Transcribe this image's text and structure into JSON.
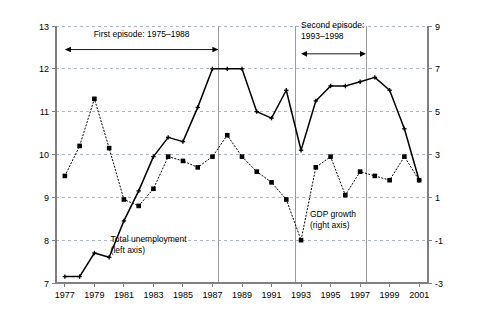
{
  "chart_data": {
    "type": "line",
    "title": "",
    "xlabel": "",
    "ylabel": "",
    "x": [
      1977,
      1978,
      1979,
      1980,
      1981,
      1982,
      1983,
      1984,
      1985,
      1986,
      1987,
      1988,
      1989,
      1990,
      1991,
      1992,
      1993,
      1994,
      1995,
      1996,
      1997,
      1998,
      1999,
      2000,
      2001
    ],
    "xlim": [
      1976.4,
      2001.6
    ],
    "xticks": [
      1977,
      1979,
      1981,
      1983,
      1985,
      1987,
      1989,
      1991,
      1993,
      1995,
      1997,
      1999,
      2001
    ],
    "xtick_labels": [
      "1977",
      "1979",
      "1981",
      "1983",
      "1985",
      "1987",
      "1989",
      "1991",
      "1993",
      "1995",
      "1997",
      "1999",
      "2001"
    ],
    "grid": true,
    "legend_position": "inline-annotation",
    "left_axis": {
      "label": "Total unemployment (left axis)",
      "ylim": [
        7,
        13
      ],
      "yticks": [
        7,
        8,
        9,
        10,
        11,
        12,
        13
      ],
      "ytick_labels": [
        "7",
        "8",
        "9",
        "10",
        "11",
        "12",
        "13"
      ]
    },
    "right_axis": {
      "label": "GDP growth (right axis)",
      "ylim": [
        -3,
        9
      ],
      "yticks": [
        -3,
        -1,
        1,
        3,
        5,
        7,
        9
      ],
      "ytick_labels": [
        "-3",
        "-1",
        "1",
        "3",
        "5",
        "7",
        "9"
      ]
    },
    "series": [
      {
        "name": "Total unemployment",
        "axis": "left",
        "style": "solid",
        "marker": "plus-small",
        "color": "#000000",
        "values": [
          7.15,
          7.15,
          7.7,
          7.6,
          8.45,
          9.15,
          9.95,
          10.4,
          10.3,
          11.1,
          12.0,
          12.0,
          12.0,
          11.0,
          10.85,
          11.5,
          10.1,
          11.25,
          11.6,
          11.6,
          11.7,
          11.8,
          11.5,
          10.6,
          9.4
        ]
      },
      {
        "name": "GDP growth",
        "axis": "right",
        "style": "dotted",
        "marker": "square",
        "color": "#000000",
        "values": [
          2.0,
          3.4,
          5.6,
          3.3,
          0.9,
          0.6,
          1.4,
          2.9,
          2.7,
          2.4,
          2.9,
          3.9,
          2.9,
          2.2,
          1.7,
          0.9,
          -1.0,
          2.4,
          2.9,
          1.1,
          2.2,
          2.0,
          1.8,
          2.9,
          1.8
        ]
      }
    ],
    "annotations": [
      {
        "name": "first-episode",
        "text_lines": [
          "First episode: 1975–1988"
        ],
        "arrow_from": 1977.0,
        "arrow_to": 1987.4,
        "arrow_y_value": 12.45,
        "text_x": 1982.2,
        "text_y_value": 12.75,
        "double_headed": true
      },
      {
        "name": "second-episode",
        "text_lines": [
          "Second episode:",
          "1993–1998"
        ],
        "arrow_from": 1993.0,
        "arrow_to": 1997.4,
        "arrow_y_value": 12.35,
        "text_x": 1993.0,
        "text_y_value": 12.95,
        "double_headed": true
      }
    ],
    "vertical_markers": [
      1987.4,
      1992.6,
      1997.4
    ],
    "series_callouts": [
      {
        "name": "unemployment-callout",
        "lines": [
          "Total unemployment",
          "(left axis)"
        ],
        "x": 1980.1,
        "y_value": 7.95
      },
      {
        "name": "gdp-callout",
        "lines": [
          "GDP growth",
          "(right axis)"
        ],
        "x": 1993.6,
        "y_value": 8.55
      }
    ],
    "colors": {
      "line": "#000000",
      "grid": "#9aa5b1",
      "axis": "#808080",
      "vertical_marker": "#9a9a9a",
      "background": "#ffffff"
    }
  }
}
